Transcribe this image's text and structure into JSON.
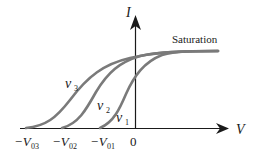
{
  "diagram": {
    "axes": {
      "x_label": "V",
      "y_label": "I"
    },
    "annotation": "Saturation",
    "curves": [
      {
        "label": "ν",
        "subscript": "1",
        "stopping_voltage_label": "−V",
        "stopping_voltage_subscript": "01"
      },
      {
        "label": "ν",
        "subscript": "2",
        "stopping_voltage_label": "−V",
        "stopping_voltage_subscript": "02"
      },
      {
        "label": "ν",
        "subscript": "3",
        "stopping_voltage_label": "−V",
        "stopping_voltage_subscript": "03"
      }
    ],
    "origin_label": "0",
    "colors": {
      "curve": "#7a7a7a",
      "axis": "#1a1a1a"
    }
  }
}
